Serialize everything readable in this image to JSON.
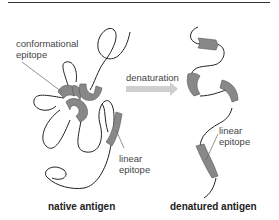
{
  "diagram": {
    "labels": {
      "conformational_epitope": [
        "conformational",
        "epitope"
      ],
      "linear_epitope_native": [
        "linear",
        "epitope"
      ],
      "linear_epitope_denatured": [
        "linear",
        "epitope"
      ],
      "process": "denaturation"
    },
    "captions": {
      "native": "native antigen",
      "denatured": "denatured antigen"
    },
    "colors": {
      "chain": "#222222",
      "epitope_fill": "#888888",
      "arrow": "#c8c8c8",
      "leader": "#666666"
    }
  }
}
